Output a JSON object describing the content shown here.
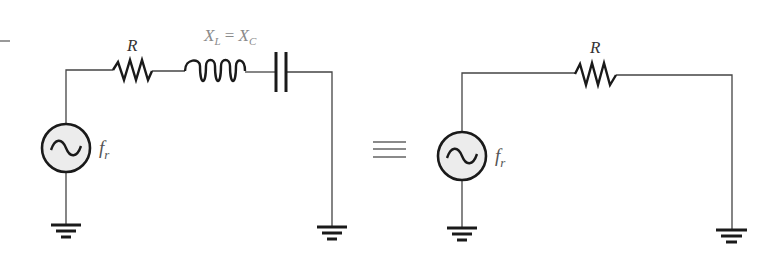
{
  "figure": {
    "colors": {
      "wire": "#444444",
      "component": "#1a1a1a",
      "label_dark": "#333333",
      "label_gray": "#8a8a8a",
      "source_fill": "#ececec",
      "equivalence": "#8a8a8a"
    }
  },
  "left_circuit": {
    "resistor_label": "R",
    "reactance_label_main_1": "X",
    "reactance_label_sub_1": "L",
    "reactance_label_eq": " = ",
    "reactance_label_main_2": "X",
    "reactance_label_sub_2": "C",
    "source_label_main": "f",
    "source_label_sub": "r"
  },
  "equivalence_symbol": "≡",
  "right_circuit": {
    "resistor_label": "R",
    "source_label_main": "f",
    "source_label_sub": "r"
  }
}
